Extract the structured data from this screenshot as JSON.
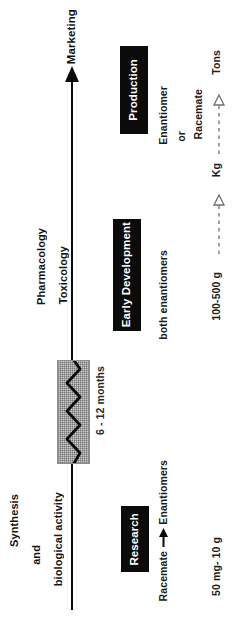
{
  "diagram": {
    "orientation": "rotated-90-ccw",
    "axis": {
      "name": "development-timeline-axis",
      "end_label": "Marketing",
      "direction": "upward"
    },
    "research_labels": {
      "synthesis": "Synthesis",
      "and": "and",
      "biological_activity": "biological activity",
      "pharmacology": "Pharmacology",
      "toxicology": "Toxicology"
    },
    "break": {
      "duration_label": "6 - 12 months",
      "symbol": "zigzag-break"
    },
    "stages": [
      {
        "id": "research",
        "label": "Research"
      },
      {
        "id": "early-development",
        "label": "Early Development"
      },
      {
        "id": "production",
        "label": "Production"
      }
    ],
    "chirality": {
      "racemate": "Racemate",
      "enantiomers": "Enantiomers",
      "both_enantiomers": "both enantiomers",
      "enantiomer": "Enantiomer",
      "or": "or",
      "racemate2": "Racemate"
    },
    "scale": {
      "research_amount": "50 mg- 10 g",
      "development_amount": "100-500 g",
      "kilogram": "Kg",
      "tons": "Tons"
    },
    "colors": {
      "ink": "#0a0a0a",
      "box_fill": "#0b0b0b",
      "box_text": "#ffffff",
      "break_fill": "#c9c9c9",
      "break_stroke": "#8e8e8e",
      "dash": "#6f6f6f"
    }
  }
}
